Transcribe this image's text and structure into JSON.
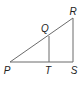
{
  "figure": {
    "type": "geometry",
    "line_color": "#6b6b6b",
    "label_color": "#222222",
    "points": {
      "P": {
        "label": "P",
        "x": 10,
        "y": 62
      },
      "Q": {
        "label": "Q",
        "x": 49,
        "y": 36
      },
      "R": {
        "label": "R",
        "x": 73,
        "y": 18
      },
      "S": {
        "label": "S",
        "x": 73,
        "y": 62
      },
      "T": {
        "label": "T",
        "x": 49,
        "y": 62
      }
    },
    "segments": [
      [
        "P",
        "R"
      ],
      [
        "P",
        "S"
      ],
      [
        "R",
        "S"
      ],
      [
        "Q",
        "T"
      ]
    ],
    "labels": [
      {
        "point": "R",
        "text": "R",
        "x": 73,
        "y": 12
      },
      {
        "point": "Q",
        "text": "Q",
        "x": 45,
        "y": 29
      },
      {
        "point": "P",
        "text": "P",
        "x": 7,
        "y": 71
      },
      {
        "point": "T",
        "text": "T",
        "x": 48,
        "y": 71
      },
      {
        "point": "S",
        "text": "S",
        "x": 74,
        "y": 71
      }
    ]
  }
}
